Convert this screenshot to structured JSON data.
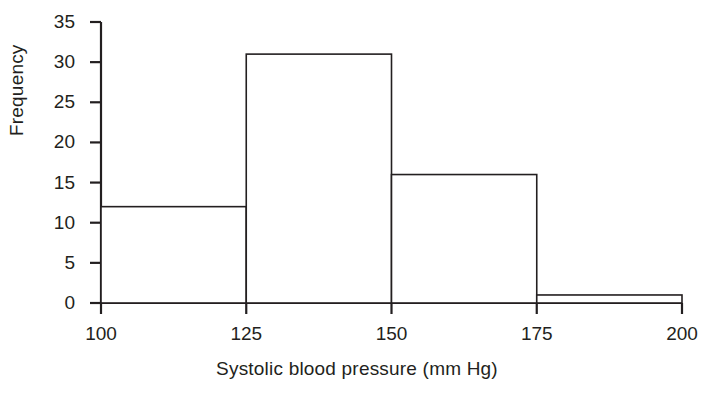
{
  "chart_data": {
    "type": "bar",
    "title": "",
    "subtitle": "",
    "xlabel": "Systolic blood pressure (mm Hg)",
    "ylabel": "Frequency",
    "histogram": true,
    "bin_edges": [
      100,
      125,
      150,
      175,
      200
    ],
    "categories": [
      "100-125",
      "125-150",
      "150-175",
      "175-200"
    ],
    "values": [
      12,
      31,
      16,
      1
    ],
    "bin_width": 25,
    "xlim": [
      100,
      200
    ],
    "ylim": [
      0,
      35
    ],
    "xticks": [
      100,
      125,
      150,
      175,
      200
    ],
    "yticks": [
      0,
      5,
      10,
      15,
      20,
      25,
      30,
      35
    ],
    "xtick_labels": [
      "100",
      "125",
      "150",
      "175",
      "200"
    ],
    "ytick_labels": [
      "0",
      "5",
      "10",
      "15",
      "20",
      "25",
      "30",
      "35"
    ],
    "grid": false,
    "legend": null,
    "legend_position": "none",
    "annotations": [],
    "series": [
      {
        "name": "Frequency",
        "values": [
          12,
          31,
          16,
          1
        ]
      }
    ],
    "colors": {
      "bar_fill": "#ffffff",
      "bar_stroke": "#231f20",
      "axis": "#231f20",
      "text": "#231f20",
      "background": "#ffffff"
    }
  },
  "axis_titles": {
    "y": "Frequency",
    "x": "Systolic blood pressure (mm Hg)"
  }
}
